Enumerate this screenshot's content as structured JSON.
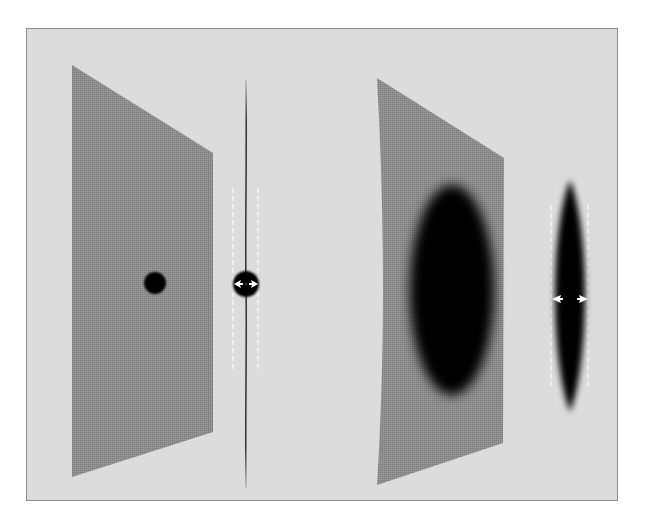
{
  "figure": {
    "background_color": "#dcdcdc",
    "frame_border_color": "#8a8a8a",
    "sheet_color": "#8c8c8c",
    "defect_color": "#000000",
    "arrow_color": "#ffffff",
    "dashed_line_color": "#f4f4f4",
    "panels": [
      {
        "name": "small-defect",
        "sheet": {
          "points": "72,65 213,153 213,432 72,477"
        },
        "defect": {
          "shape": "circle",
          "cx": 155,
          "cy": 283,
          "r": 11
        },
        "side_view": {
          "x": 246,
          "line_top": 80,
          "line_bottom": 488,
          "defect": {
            "shape": "circle",
            "cx": 246,
            "cy": 284,
            "r": 13
          },
          "dashed_left_x": 233,
          "dashed_right_x": 258,
          "dashed_top": 188,
          "dashed_bottom": 372,
          "arrows": "outward"
        }
      },
      {
        "name": "large-defect",
        "sheet": {
          "points": "377,78 504,158 503,443 377,485"
        },
        "defect": {
          "shape": "ellipse",
          "cx": 452,
          "cy": 290,
          "rx": 42,
          "ry": 105
        },
        "side_view": {
          "x": 570,
          "line_top": 85,
          "line_bottom": 495,
          "defect": {
            "shape": "spindle",
            "top": 180,
            "bottom": 412,
            "half_width": 18
          },
          "dashed_left_x": 551,
          "dashed_right_x": 588,
          "dashed_top": 205,
          "dashed_bottom": 388,
          "arrows": "outward"
        }
      }
    ]
  }
}
